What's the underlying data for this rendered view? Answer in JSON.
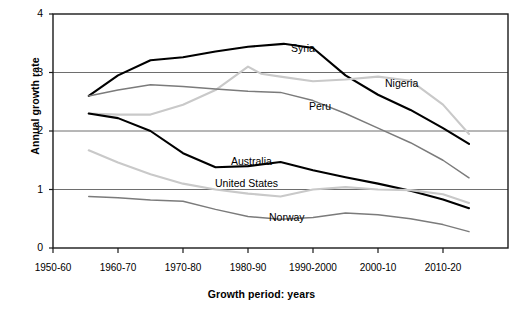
{
  "chart_data": {
    "type": "line",
    "title": "",
    "xlabel": "Growth period: years",
    "ylabel": "Annual growth rate",
    "categories": [
      "1950-60",
      "1960-70",
      "1970-80",
      "1980-90",
      "1990-2000",
      "2000-10",
      "2010-20"
    ],
    "x_tick_labels": [
      "1950-60",
      "1960-70",
      "1970-80",
      "1980-90",
      "1990-2000",
      "2000-10",
      "2010-20"
    ],
    "y_tick_labels": [
      "0",
      "1",
      "2",
      "3",
      "4"
    ],
    "ylim": [
      0,
      4
    ],
    "yticks": [
      0,
      1,
      2,
      3,
      4
    ],
    "grid": "horizontal",
    "legend": "inline-labels",
    "series": [
      {
        "name": "Syria",
        "color": "#000000",
        "width": 2.1,
        "label_x": 291,
        "label_y": 42,
        "x": [
          0.55,
          1.0,
          1.5,
          2.0,
          2.5,
          3.0,
          3.55,
          4.0,
          4.5,
          5.0,
          5.5,
          6.0,
          6.4
        ],
        "values": [
          2.6,
          2.95,
          3.21,
          3.26,
          3.36,
          3.44,
          3.49,
          3.42,
          2.95,
          2.62,
          2.36,
          2.05,
          1.78
        ]
      },
      {
        "name": "Nigeria",
        "color": "#c9c9c9",
        "width": 2.1,
        "label_x": 385,
        "label_y": 77,
        "x": [
          0.55,
          1.0,
          1.5,
          2.0,
          2.5,
          3.0,
          3.2,
          3.5,
          4.0,
          4.5,
          5.0,
          5.5,
          6.0,
          6.4
        ],
        "values": [
          2.3,
          2.28,
          2.28,
          2.45,
          2.7,
          3.1,
          2.98,
          2.93,
          2.85,
          2.88,
          2.93,
          2.86,
          2.45,
          1.95
        ]
      },
      {
        "name": "Peru",
        "color": "#7b7b7b",
        "width": 1.5,
        "label_x": 309,
        "label_y": 100,
        "x": [
          0.55,
          1.0,
          1.5,
          2.0,
          2.5,
          3.0,
          3.5,
          4.0,
          4.5,
          5.0,
          5.5,
          6.0,
          6.4
        ],
        "values": [
          2.6,
          2.7,
          2.79,
          2.76,
          2.72,
          2.68,
          2.66,
          2.52,
          2.3,
          2.05,
          1.8,
          1.5,
          1.2
        ]
      },
      {
        "name": "Australia",
        "color": "#000000",
        "width": 2.1,
        "label_x": 231,
        "label_y": 155,
        "x": [
          0.55,
          1.0,
          1.5,
          2.0,
          2.5,
          3.0,
          3.5,
          4.0,
          4.5,
          5.0,
          5.5,
          6.0,
          6.4
        ],
        "values": [
          2.3,
          2.22,
          2.0,
          1.62,
          1.38,
          1.4,
          1.47,
          1.33,
          1.21,
          1.1,
          0.98,
          0.83,
          0.68
        ]
      },
      {
        "name": "United States",
        "color": "#c9c9c9",
        "width": 2.1,
        "label_x": 215,
        "label_y": 177,
        "x": [
          0.55,
          1.0,
          1.5,
          2.0,
          2.5,
          3.0,
          3.5,
          4.0,
          4.5,
          5.0,
          5.5,
          6.0,
          6.4
        ],
        "values": [
          1.67,
          1.46,
          1.26,
          1.1,
          1.0,
          0.93,
          0.88,
          1.0,
          1.04,
          1.0,
          0.99,
          0.92,
          0.77
        ]
      },
      {
        "name": "Norway",
        "color": "#7b7b7b",
        "width": 1.5,
        "label_x": 269,
        "label_y": 211,
        "x": [
          0.55,
          1.0,
          1.5,
          2.0,
          2.5,
          3.0,
          3.5,
          4.0,
          4.5,
          5.0,
          5.5,
          6.0,
          6.4
        ],
        "values": [
          0.88,
          0.86,
          0.82,
          0.8,
          0.66,
          0.54,
          0.49,
          0.52,
          0.6,
          0.57,
          0.5,
          0.4,
          0.28
        ]
      }
    ]
  },
  "axes": {
    "y_title": "Annual growth rate",
    "x_title": "Growth period: years"
  }
}
